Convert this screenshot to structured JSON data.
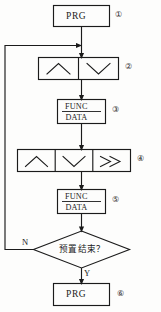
{
  "diagram": {
    "type": "flowchart",
    "title": "",
    "orientation": "vertical",
    "background_color": "#fdfdfc",
    "line_color": "#1b1b1b",
    "nodes": [
      {
        "id": "n1",
        "step": "①",
        "shape": "rectangle",
        "label": "PRG",
        "kind": "key-press"
      },
      {
        "id": "n2",
        "step": "②",
        "shape": "rectangle-split-2",
        "label": "",
        "cells": [
          "∧",
          "∨"
        ],
        "cell_names": [
          "up-chevron-icon",
          "down-chevron-icon"
        ],
        "kind": "key-press"
      },
      {
        "id": "n3",
        "step": "③",
        "shape": "rectangle-divided",
        "label_top": "FUNC",
        "label_bottom": "DATA",
        "kind": "key-press"
      },
      {
        "id": "n4",
        "step": "④",
        "shape": "rectangle-split-3",
        "label": "",
        "cells": [
          "∧",
          "∨",
          "≫"
        ],
        "cell_names": [
          "up-chevron-icon",
          "down-chevron-icon",
          "double-right-chevron-icon"
        ],
        "kind": "key-press"
      },
      {
        "id": "n5",
        "step": "⑤",
        "shape": "rectangle-divided",
        "label_top": "FUNC",
        "label_bottom": "DATA",
        "kind": "key-press"
      },
      {
        "id": "n6",
        "step": "",
        "shape": "diamond",
        "label": "预置结束？",
        "kind": "decision"
      },
      {
        "id": "n7",
        "step": "⑥",
        "shape": "rectangle",
        "label": "PRG",
        "kind": "key-press"
      }
    ],
    "edges": [
      {
        "from": "n1",
        "to": "n2",
        "label": ""
      },
      {
        "from": "n2",
        "to": "n3",
        "label": ""
      },
      {
        "from": "n3",
        "to": "n4",
        "label": ""
      },
      {
        "from": "n4",
        "to": "n5",
        "label": ""
      },
      {
        "from": "n5",
        "to": "n6",
        "label": ""
      },
      {
        "from": "n6",
        "to": "n7",
        "label": "Y"
      },
      {
        "from": "n6",
        "to": "n2",
        "label": "N",
        "route": "loop-left"
      }
    ],
    "branch_labels": {
      "no": "N",
      "yes": "Y"
    }
  }
}
